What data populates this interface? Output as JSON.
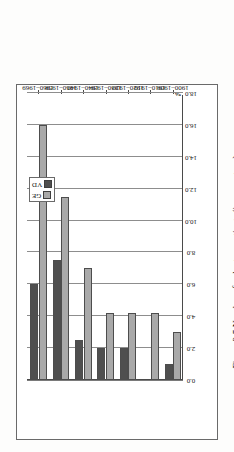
{
  "figure": {
    "caption": "Figure 2.5  Number of voluntary patients (in percentage)",
    "axis_title": "%"
  },
  "legend": {
    "position": "top-center-inside",
    "items": [
      {
        "label": "GE",
        "color": "#a9a9a9"
      },
      {
        "label": "VD",
        "color": "#4f4f4f"
      }
    ]
  },
  "chart_data": {
    "type": "bar",
    "orientation": "horizontal-rotated",
    "title": "Figure 2.5  Number of voluntary patients (in percentage)",
    "xlabel": "",
    "ylabel": "%",
    "categories": [
      "1900–1909",
      "1910–1919",
      "1920–1929",
      "1930–1939",
      "1940–1949",
      "1950–1959",
      "1960–1969"
    ],
    "series": [
      {
        "name": "GE",
        "color": "#a9a9a9",
        "values": [
          3.0,
          4.2,
          4.2,
          4.2,
          7.0,
          11.5,
          16.0
        ]
      },
      {
        "name": "VD",
        "color": "#4f4f4f",
        "values": [
          1.0,
          0.0,
          2.0,
          2.0,
          2.5,
          7.5,
          6.0
        ]
      }
    ],
    "value_axis": {
      "ticks": [
        "0.0",
        "2.0",
        "4.0",
        "6.0",
        "8.0",
        "10.0",
        "12.0",
        "14.0",
        "16.0",
        "18.0"
      ],
      "tick_values": [
        0,
        2,
        4,
        6,
        8,
        10,
        12,
        14,
        16,
        18
      ],
      "limits": [
        0,
        18
      ],
      "unit": "%"
    },
    "grid": true,
    "legend_position": "inside-top"
  }
}
